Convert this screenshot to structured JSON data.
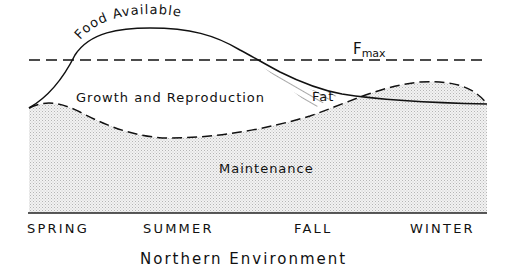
{
  "diagram": {
    "title": "Northern Environment",
    "curves": {
      "food_label": "Food Available",
      "fmax_label": "F",
      "fmax_subscript": "max"
    },
    "regions": {
      "growth": "Growth and Reproduction",
      "fat": "Fat",
      "maintenance": "Maintenance"
    },
    "seasons": [
      "SPRING",
      "SUMMER",
      "FALL",
      "WINTER"
    ],
    "colors": {
      "ink": "#111111",
      "stipple": "#d9d9d9",
      "background": "#ffffff"
    }
  }
}
